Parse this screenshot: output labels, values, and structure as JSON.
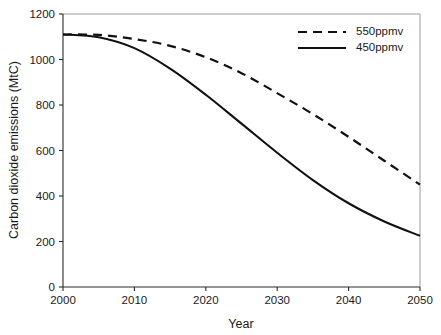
{
  "chart_data": {
    "type": "line",
    "title": "",
    "xlabel": "Year",
    "ylabel": "Carbon dioxide emissions (MtC)",
    "xlim": [
      2000,
      2050
    ],
    "ylim": [
      0,
      1200
    ],
    "xticks": [
      "2000",
      "2010",
      "2020",
      "2030",
      "2040",
      "2050"
    ],
    "yticks": [
      "0",
      "200",
      "400",
      "600",
      "800",
      "1000",
      "1200"
    ],
    "grid": false,
    "legend_position": "top-right",
    "x": [
      2000,
      2005,
      2010,
      2015,
      2020,
      2025,
      2030,
      2035,
      2040,
      2045,
      2050
    ],
    "series": [
      {
        "name": "550ppmv",
        "style": "dashed",
        "color": "#111111",
        "values": [
          1110,
          1108,
          1090,
          1060,
          1010,
          940,
          852,
          760,
          660,
          555,
          450
        ]
      },
      {
        "name": "450ppmv",
        "style": "solid",
        "color": "#111111",
        "values": [
          1110,
          1098,
          1050,
          960,
          845,
          718,
          590,
          470,
          368,
          288,
          225
        ]
      }
    ]
  },
  "legend": {
    "items": [
      {
        "label": "550ppmv",
        "style": "dashed"
      },
      {
        "label": "450ppmv",
        "style": "solid"
      }
    ]
  },
  "axes": {
    "x_title": "Year",
    "y_title": "Carbon dioxide emissions (MtC)"
  }
}
